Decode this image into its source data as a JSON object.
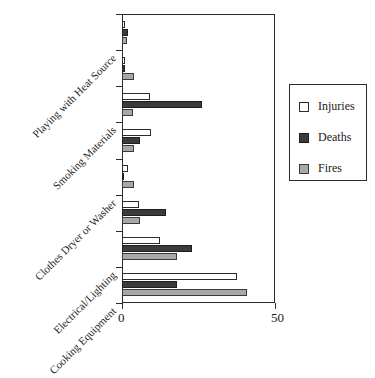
{
  "chart_data": {
    "type": "bar",
    "orientation": "horizontal",
    "title": "",
    "xlabel": "",
    "ylabel": "",
    "xlim": [
      0,
      50
    ],
    "xticks": [
      0,
      50
    ],
    "xtick_labels": [
      "0",
      "50"
    ],
    "grid": false,
    "legend_position": "right",
    "categories": [
      "Playing with Heat Source",
      "",
      "Smoking Materials",
      "",
      "Clothes Dryer or Washer",
      "",
      "Electrical/Lighting",
      "Cooking Equipment"
    ],
    "visible_category_labels": [
      "Playing with Heat Source",
      "Smoking Materials",
      "Clothes Dryer or Washer",
      "Electrical/Lighting",
      "Cooking Equipment"
    ],
    "series": [
      {
        "name": "Injuries",
        "color": "#ffffff",
        "values": [
          1,
          1,
          9,
          9.5,
          2,
          5.5,
          12.5,
          37.5
        ]
      },
      {
        "name": "Deaths",
        "color": "#3b3b3b",
        "values": [
          2,
          1,
          26,
          6,
          0.5,
          14.5,
          23,
          18
        ]
      },
      {
        "name": "Fires",
        "color": "#a8a8a8",
        "values": [
          1.5,
          4,
          3.5,
          4,
          4,
          6,
          18,
          41
        ]
      }
    ]
  },
  "legend": {
    "items": [
      {
        "label": "Injuries",
        "swatch": "legend-swatch-injuries"
      },
      {
        "label": "Deaths",
        "swatch": "legend-swatch-deaths"
      },
      {
        "label": "Fires",
        "swatch": "legend-swatch-fires"
      }
    ]
  },
  "axis": {
    "x_tick_labels": [
      "0",
      "50"
    ]
  }
}
